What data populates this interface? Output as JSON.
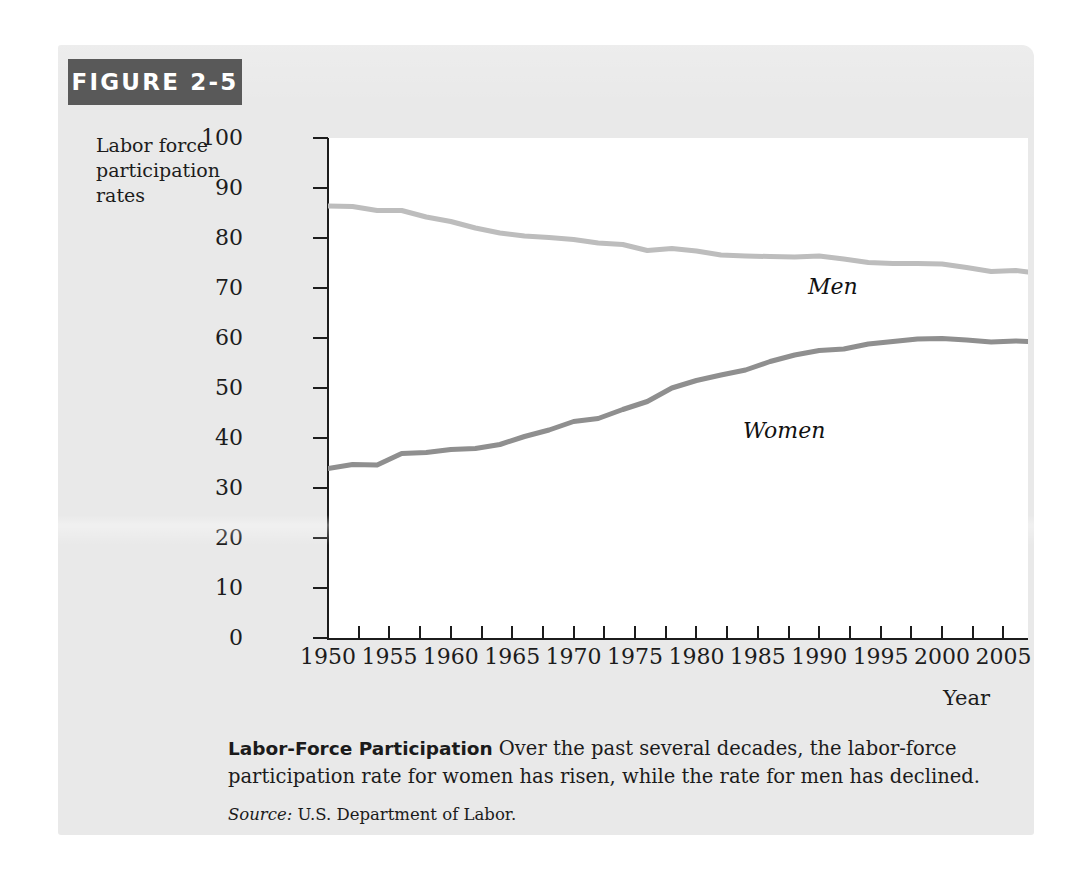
{
  "figure": {
    "header_label": "FIGURE 2-5",
    "y_axis_title": "Labor force participation rates",
    "x_axis_title": "Year",
    "caption_lead": "Labor-Force Participation",
    "caption_body": "Over the past several decades, the labor-force participation rate for women has risen, while the rate for men has declined.",
    "source_label": "Source:",
    "source_text": "U.S. Department of Labor."
  },
  "colors": {
    "header_bar": "#595959",
    "card_background": "#e9e9e9",
    "plot_background": "#ffffff",
    "axis": "#1c1c1c",
    "men_line": "#bdbdbd",
    "women_line": "#8f8f8f"
  },
  "chart_data": {
    "type": "line",
    "title": "Labor-Force Participation",
    "xlabel": "Year",
    "ylabel": "Labor force participation rates",
    "xlim": [
      1950,
      2007
    ],
    "ylim": [
      0,
      100
    ],
    "grid": false,
    "legend": "inline-series-labels",
    "y_ticks": [
      0,
      10,
      20,
      30,
      40,
      50,
      60,
      70,
      80,
      90,
      100
    ],
    "x_ticks": [
      1950,
      1955,
      1960,
      1965,
      1970,
      1975,
      1980,
      1985,
      1990,
      1995,
      2000,
      2005
    ],
    "x_minor_ticks": [
      1952.5,
      1957.5,
      1962.5,
      1967.5,
      1972.5,
      1977.5,
      1982.5,
      1987.5,
      1992.5,
      1997.5,
      2002.5
    ],
    "x": [
      1950,
      1952,
      1954,
      1956,
      1958,
      1960,
      1962,
      1964,
      1966,
      1968,
      1970,
      1972,
      1974,
      1976,
      1978,
      1980,
      1982,
      1984,
      1986,
      1988,
      1990,
      1992,
      1994,
      1996,
      1998,
      2000,
      2002,
      2004,
      2006,
      2007
    ],
    "series": [
      {
        "name": "Men",
        "color": "#bdbdbd",
        "values": [
          86.4,
          86.3,
          85.5,
          85.5,
          84.2,
          83.3,
          82.0,
          81.0,
          80.4,
          80.1,
          79.7,
          79.0,
          78.7,
          77.5,
          77.9,
          77.4,
          76.6,
          76.4,
          76.3,
          76.2,
          76.4,
          75.8,
          75.1,
          74.9,
          74.9,
          74.8,
          74.1,
          73.3,
          73.5,
          73.2
        ]
      },
      {
        "name": "Women",
        "color": "#8f8f8f",
        "values": [
          33.9,
          34.7,
          34.6,
          36.9,
          37.1,
          37.7,
          37.9,
          38.7,
          40.3,
          41.6,
          43.3,
          43.9,
          45.7,
          47.3,
          50.0,
          51.5,
          52.6,
          53.6,
          55.3,
          56.6,
          57.5,
          57.8,
          58.8,
          59.3,
          59.8,
          59.9,
          59.6,
          59.2,
          59.4,
          59.3
        ]
      }
    ]
  }
}
